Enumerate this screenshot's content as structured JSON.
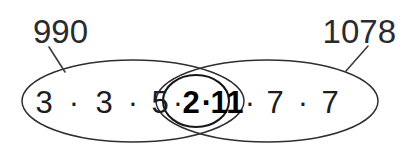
{
  "figure": {
    "callouts": [
      {
        "id": "left",
        "label": "990"
      },
      {
        "id": "right",
        "label": "1078"
      }
    ],
    "sets": {
      "left_only": {
        "label": "990",
        "factors": [
          "3",
          "3",
          "5"
        ],
        "separator": "·"
      },
      "intersection": {
        "factors": [
          "2",
          "11"
        ],
        "separator": "·",
        "emphasis": "bold"
      },
      "right_only": {
        "label": "1078",
        "factors": [
          "7",
          "7"
        ],
        "separator": "·"
      }
    },
    "expression_tokens": [
      {
        "text": "3",
        "bold": false
      },
      {
        "text": "·",
        "bold": false
      },
      {
        "text": "3",
        "bold": false
      },
      {
        "text": "·",
        "bold": false
      },
      {
        "text": "5",
        "bold": false
      },
      {
        "text": "·",
        "bold": false
      },
      {
        "text": "2",
        "bold": true
      },
      {
        "text": "·",
        "bold": true
      },
      {
        "text": "11",
        "bold": true
      },
      {
        "text": "·",
        "bold": false
      },
      {
        "text": "7",
        "bold": false
      },
      {
        "text": "·",
        "bold": false
      },
      {
        "text": "7",
        "bold": false
      }
    ],
    "colors": {
      "outline": "#2e2e33",
      "inner_outline": "#17171a",
      "text": "#1d1d21",
      "callout_text": "#2a2a2f",
      "leader": "#3a3a40",
      "background": "#ffffff"
    }
  }
}
